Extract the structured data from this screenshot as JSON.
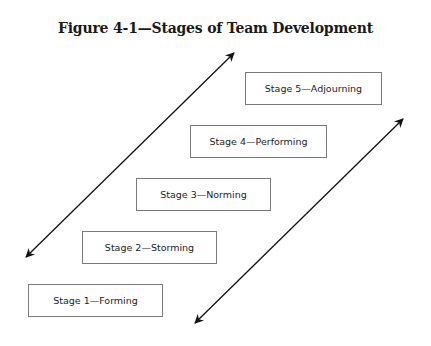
{
  "title": "Figure 4-1—Stages of Team Development",
  "stages": [
    {
      "label": "Stage 1—Forming"
    },
    {
      "label": "Stage 2—Storming"
    },
    {
      "label": "Stage 3—Norming"
    },
    {
      "label": "Stage 4—Performing"
    },
    {
      "label": "Stage 5—Adjourning"
    }
  ],
  "arrows": [
    {
      "name": "left-double-arrow",
      "from": [
        26,
        257
      ],
      "to": [
        234,
        53
      ]
    },
    {
      "name": "right-double-arrow",
      "from": [
        195,
        323
      ],
      "to": [
        403,
        119
      ]
    }
  ],
  "colors": {
    "box_border": "#7a7a7a",
    "arrow": "#111111",
    "text": "#222222"
  }
}
